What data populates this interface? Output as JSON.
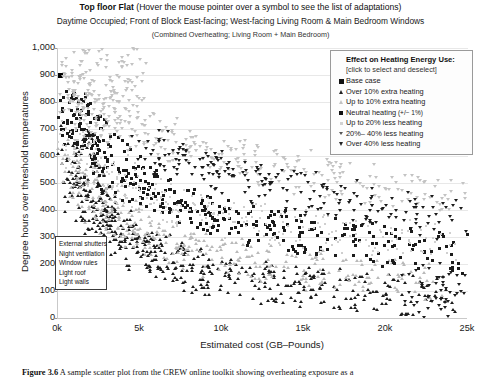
{
  "chart_data": {
    "type": "scatter",
    "title": "Top floor Flat (Hover the mouse pointer over a symbol to see the list of adaptations)",
    "title_bold_part": "Top floor Flat",
    "title_normal_part": "(Hover the mouse pointer over a symbol to see the list of adaptations)",
    "subtitle": "Daytime Occupied; Front of Block East-facing; West-facing Living Room & Main Bedroom Windows",
    "subtitle2": "(Combined Overheating; Living Room + Main Bedroom)",
    "xlabel": "Estimated cost (GB–Pounds)",
    "ylabel": "Degree hours over threshold temperatures",
    "xlim": [
      0,
      25000
    ],
    "ylim": [
      0,
      1000
    ],
    "xticks": [
      0,
      5000,
      10000,
      15000,
      20000,
      25000
    ],
    "xticklabels": [
      "0k",
      "5k",
      "10k",
      "15k",
      "20k",
      "25k"
    ],
    "yticks": [
      0,
      100,
      200,
      300,
      400,
      500,
      600,
      700,
      800,
      900,
      1000
    ],
    "yticklabels": [
      "0",
      "100",
      "200",
      "300",
      "400",
      "500",
      "600",
      "700",
      "800",
      "900",
      "1,000"
    ],
    "grid": "horizontal",
    "legend_position": "top-right-inside",
    "series": [
      {
        "name": "Base case",
        "marker": "square-dark",
        "points": [
          [
            180,
            900
          ]
        ]
      },
      {
        "name": "Over 10% extra heating",
        "marker": "triangle-up-dark",
        "points": [
          [
            900,
            640
          ],
          [
            1100,
            600
          ],
          [
            1250,
            560
          ],
          [
            1400,
            520
          ],
          [
            1600,
            495
          ],
          [
            1700,
            470
          ],
          [
            1850,
            455
          ],
          [
            2000,
            430
          ],
          [
            2200,
            415
          ],
          [
            2400,
            400
          ],
          [
            2600,
            380
          ],
          [
            2800,
            360
          ],
          [
            3000,
            345
          ],
          [
            3200,
            330
          ],
          [
            3500,
            320
          ],
          [
            3800,
            300
          ],
          [
            4100,
            290
          ],
          [
            4400,
            275
          ],
          [
            4800,
            265
          ],
          [
            5200,
            250
          ],
          [
            5600,
            240
          ],
          [
            6000,
            230
          ],
          [
            6500,
            215
          ],
          [
            7000,
            205
          ],
          [
            7600,
            195
          ],
          [
            8200,
            185
          ],
          [
            8800,
            175
          ],
          [
            9400,
            165
          ],
          [
            10200,
            155
          ],
          [
            11000,
            145
          ],
          [
            11800,
            140
          ],
          [
            12600,
            130
          ],
          [
            13400,
            125
          ],
          [
            14200,
            120
          ],
          [
            15000,
            115
          ],
          [
            16000,
            110
          ],
          [
            17000,
            105
          ],
          [
            18000,
            100
          ],
          [
            19000,
            95
          ],
          [
            20000,
            90
          ],
          [
            21000,
            88
          ],
          [
            22000,
            85
          ],
          [
            23000,
            82
          ]
        ]
      },
      {
        "name": "Up to 10% extra heating",
        "marker": "triangle-up-light",
        "points": [
          [
            1000,
            610
          ],
          [
            1300,
            575
          ],
          [
            1550,
            540
          ],
          [
            1800,
            505
          ],
          [
            2100,
            480
          ],
          [
            2500,
            450
          ],
          [
            2900,
            420
          ],
          [
            3300,
            395
          ],
          [
            3700,
            370
          ],
          [
            4200,
            350
          ],
          [
            4700,
            330
          ],
          [
            5300,
            310
          ],
          [
            5900,
            295
          ],
          [
            6600,
            280
          ],
          [
            7400,
            265
          ],
          [
            8200,
            250
          ],
          [
            9000,
            240
          ],
          [
            10000,
            225
          ],
          [
            11000,
            215
          ],
          [
            12000,
            205
          ],
          [
            13000,
            195
          ],
          [
            14000,
            185
          ],
          [
            15000,
            175
          ],
          [
            16500,
            168
          ],
          [
            18000,
            160
          ],
          [
            19500,
            150
          ],
          [
            21000,
            145
          ],
          [
            22500,
            138
          ]
        ]
      },
      {
        "name": "Neutral heating (+/− 1%)",
        "marker": "square-dark-small",
        "points": [
          [
            700,
            800
          ],
          [
            850,
            770
          ],
          [
            1000,
            755
          ],
          [
            1150,
            740
          ],
          [
            1400,
            720
          ],
          [
            1600,
            700
          ],
          [
            1900,
            670
          ],
          [
            2200,
            650
          ],
          [
            2500,
            620
          ],
          [
            2900,
            595
          ],
          [
            3300,
            570
          ],
          [
            3700,
            550
          ],
          [
            4200,
            525
          ],
          [
            4700,
            500
          ],
          [
            5200,
            480
          ],
          [
            5800,
            460
          ],
          [
            6400,
            440
          ],
          [
            7100,
            425
          ],
          [
            7800,
            410
          ],
          [
            8500,
            395
          ],
          [
            9300,
            380
          ],
          [
            10100,
            370
          ],
          [
            11000,
            355
          ],
          [
            11900,
            345
          ],
          [
            12800,
            335
          ],
          [
            13800,
            325
          ],
          [
            14800,
            315
          ],
          [
            15800,
            305
          ],
          [
            16900,
            295
          ],
          [
            18000,
            285
          ],
          [
            19200,
            275
          ],
          [
            20400,
            265
          ],
          [
            21600,
            255
          ],
          [
            22800,
            245
          ],
          [
            24000,
            235
          ]
        ]
      },
      {
        "name": "Up to 20% less heating",
        "marker": "dot-light",
        "points": [
          [
            800,
            690
          ],
          [
            1100,
            660
          ],
          [
            1500,
            630
          ],
          [
            1900,
            600
          ],
          [
            2400,
            570
          ],
          [
            3000,
            540
          ],
          [
            3600,
            515
          ],
          [
            4300,
            490
          ],
          [
            5000,
            470
          ],
          [
            5800,
            450
          ],
          [
            6600,
            430
          ],
          [
            7500,
            415
          ],
          [
            8400,
            400
          ],
          [
            9400,
            385
          ],
          [
            10400,
            370
          ],
          [
            11500,
            360
          ],
          [
            12700,
            350
          ],
          [
            14000,
            340
          ],
          [
            15300,
            330
          ],
          [
            16700,
            320
          ],
          [
            18200,
            310
          ],
          [
            19800,
            300
          ],
          [
            21400,
            290
          ],
          [
            23000,
            280
          ]
        ]
      },
      {
        "name": "20% – 40% less heating",
        "marker": "triangle-down-mid",
        "points": [
          [
            500,
            960
          ],
          [
            1400,
            950
          ],
          [
            2600,
            955
          ],
          [
            3900,
            950
          ],
          [
            600,
            870
          ],
          [
            3200,
            880
          ],
          [
            4100,
            875
          ],
          [
            4500,
            870
          ],
          [
            900,
            835
          ],
          [
            1700,
            830
          ],
          [
            2100,
            825
          ],
          [
            1200,
            790
          ],
          [
            2800,
            780
          ],
          [
            3500,
            770
          ],
          [
            4300,
            765
          ],
          [
            1600,
            730
          ],
          [
            2300,
            720
          ],
          [
            3100,
            710
          ],
          [
            3900,
            700
          ],
          [
            4700,
            690
          ],
          [
            5500,
            680
          ],
          [
            6300,
            665
          ],
          [
            7200,
            650
          ],
          [
            8100,
            635
          ],
          [
            9000,
            620
          ],
          [
            10000,
            605
          ],
          [
            11000,
            590
          ],
          [
            12100,
            575
          ],
          [
            13200,
            560
          ],
          [
            14400,
            545
          ],
          [
            15600,
            530
          ],
          [
            16900,
            515
          ],
          [
            18200,
            500
          ],
          [
            19600,
            485
          ],
          [
            21000,
            470
          ],
          [
            22400,
            455
          ],
          [
            23800,
            440
          ]
        ]
      },
      {
        "name": "Over 40% less heating",
        "marker": "triangle-down-dark",
        "points": [
          [
            5800,
            620
          ],
          [
            6500,
            600
          ],
          [
            7200,
            585
          ],
          [
            8000,
            570
          ],
          [
            8800,
            555
          ],
          [
            9700,
            540
          ],
          [
            10600,
            525
          ],
          [
            11600,
            510
          ],
          [
            12600,
            495
          ],
          [
            13700,
            480
          ],
          [
            14800,
            465
          ],
          [
            16000,
            450
          ],
          [
            17200,
            435
          ],
          [
            18500,
            420
          ],
          [
            19800,
            405
          ],
          [
            21200,
            390
          ],
          [
            22600,
            375
          ],
          [
            24000,
            360
          ],
          [
            23500,
            130
          ],
          [
            22200,
            120
          ],
          [
            23900,
            95
          ],
          [
            22800,
            60
          ]
        ]
      }
    ]
  },
  "legend": {
    "title": "Effect on Heating Energy Use:",
    "subtitle": "[click to select and deselect]",
    "items": [
      {
        "label": "Base case",
        "symbol": "square-dark",
        "suffix": ""
      },
      {
        "label": "Over 10% extra heating",
        "symbol": "triangle-up-dark",
        "suffix": ""
      },
      {
        "label": "Up to 10% extra heating",
        "symbol": "triangle-up-light",
        "suffix": ""
      },
      {
        "label": "Neutral heating",
        "symbol": "square-dark-small",
        "suffix": "(+/− 1%)"
      },
      {
        "label": "Up to 20% less heating",
        "symbol": "dot-light",
        "suffix": ""
      },
      {
        "label": "20%– 40% less heating",
        "symbol": "triangle-down-mid",
        "suffix": ""
      },
      {
        "label": "Over 40% less heating",
        "symbol": "triangle-down-dark",
        "suffix": ""
      }
    ]
  },
  "tooltip": {
    "items": [
      "External shutters",
      "Night ventilation",
      "Window rules",
      "Light roof",
      "Light walls"
    ]
  },
  "caption": {
    "label": "Figure 3.6",
    "text": "A sample scatter plot from the CREW online toolkit showing overheating exposure as a"
  },
  "colors": {
    "marker_dark": "#1b1b1b",
    "marker_light": "#c2c2c2",
    "grid": "#e8e8e8",
    "axis": "#c9c9c9",
    "text": "#1a1a1a"
  }
}
